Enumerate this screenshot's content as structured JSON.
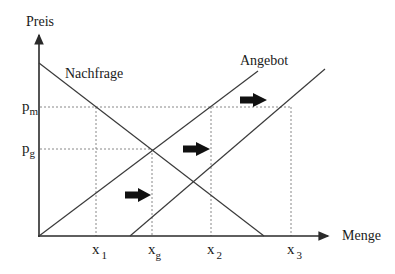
{
  "diagram": {
    "type": "supply-demand",
    "axes": {
      "y_label": "Preis",
      "x_label": "Menge"
    },
    "curves": {
      "demand_label": "Nachfrage",
      "supply_label": "Angebot"
    },
    "price_levels": [
      {
        "base": "p",
        "sub": "m"
      },
      {
        "base": "p",
        "sub": "g"
      }
    ],
    "quantity_levels": [
      {
        "base": "x",
        "sub": "1"
      },
      {
        "base": "x",
        "sub": "g"
      },
      {
        "base": "x",
        "sub": "2"
      },
      {
        "base": "x",
        "sub": "3"
      }
    ],
    "shift_arrows": 3,
    "colors": {
      "line": "#3a3a3a",
      "dotted": "#7a7a7a",
      "arrow": "#111111"
    }
  }
}
